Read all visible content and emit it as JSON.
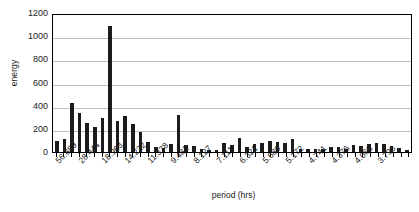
{
  "chart_data": {
    "type": "bar",
    "title": "",
    "xlabel": "period (hrs)",
    "ylabel": "energy",
    "ylim": [
      0,
      1200
    ],
    "yticks": [
      0,
      200,
      400,
      600,
      800,
      1000,
      1200
    ],
    "grid": true,
    "legend": "none",
    "xtick_labels": [
      "56.889",
      "28.444",
      "18.963",
      "14.222",
      "11.378",
      "9.481",
      "8.127",
      "7.111",
      "6.321",
      "5.689",
      "5.172",
      "4.741",
      "4.376",
      "4.063",
      "3.793"
    ],
    "xtick_label_every": 3,
    "values": [
      95,
      115,
      425,
      340,
      250,
      215,
      295,
      1085,
      265,
      310,
      240,
      170,
      85,
      40,
      35,
      70,
      320,
      60,
      55,
      25,
      15,
      18,
      80,
      60,
      125,
      45,
      70,
      75,
      95,
      90,
      80,
      110,
      30,
      25,
      30,
      28,
      45,
      40,
      22,
      60,
      55,
      70,
      78,
      72,
      55,
      35,
      20
    ],
    "max_value": 1085,
    "n_bars": 47
  },
  "axes": {
    "y_title": "energy",
    "x_title": "period (hrs)"
  }
}
